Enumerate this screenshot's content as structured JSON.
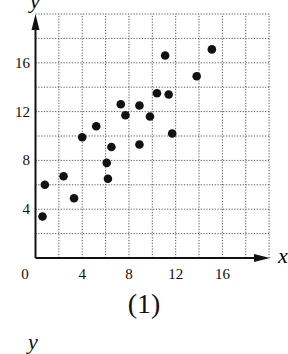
{
  "chart_data": {
    "type": "scatter",
    "title": "",
    "xlabel": "x",
    "ylabel": "y",
    "xlim": [
      0,
      20
    ],
    "ylim": [
      0,
      20
    ],
    "x_ticks": [
      0,
      4,
      8,
      12,
      16
    ],
    "y_ticks": [
      4,
      8,
      12,
      16
    ],
    "x_tick_labels": [
      "0",
      "4",
      "8",
      "12",
      "16"
    ],
    "y_tick_labels": [
      "4",
      "8",
      "12",
      "16"
    ],
    "grid": true,
    "grid_step": 2,
    "grid_style": "dotted",
    "legend": null,
    "series": [
      {
        "name": "data",
        "color": "#111111",
        "points": [
          [
            0.6,
            3.4
          ],
          [
            0.8,
            6.0
          ],
          [
            2.4,
            6.7
          ],
          [
            3.3,
            4.9
          ],
          [
            4.0,
            9.9
          ],
          [
            5.2,
            10.8
          ],
          [
            6.1,
            7.8
          ],
          [
            6.2,
            6.5
          ],
          [
            6.5,
            9.1
          ],
          [
            7.3,
            12.6
          ],
          [
            7.7,
            11.7
          ],
          [
            8.9,
            12.5
          ],
          [
            8.9,
            9.3
          ],
          [
            9.8,
            11.6
          ],
          [
            10.4,
            13.5
          ],
          [
            11.1,
            16.6
          ],
          [
            11.4,
            13.4
          ],
          [
            11.7,
            10.2
          ],
          [
            13.8,
            14.9
          ],
          [
            15.1,
            17.1
          ]
        ]
      }
    ],
    "caption": "(1)"
  },
  "figure": {
    "caption": "(1)",
    "next_axis_label": "y"
  }
}
